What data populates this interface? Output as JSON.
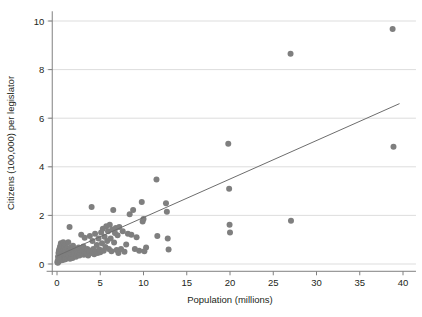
{
  "chart_data": {
    "type": "scatter",
    "title": "",
    "xlabel": "Population (millions)",
    "ylabel": "Citizens (100,000) per legislator",
    "xlim": [
      -1.2,
      41.5
    ],
    "ylim": [
      -0.45,
      10.4
    ],
    "xticks": [
      0,
      5,
      10,
      15,
      20,
      25,
      30,
      35,
      40
    ],
    "xticklabels": [
      "0",
      "5",
      "10",
      "15",
      "20",
      "25",
      "30",
      "35",
      "40"
    ],
    "yticks": [
      0,
      2,
      4,
      6,
      8,
      10
    ],
    "yticklabels": [
      "0",
      "2",
      "4",
      "6",
      "8",
      "10"
    ],
    "grid": "horizontal",
    "legend": "none",
    "marker_color": "#7f7f7f",
    "line_color": "#6d6d6d",
    "grid_color": "#d9d9d9",
    "axis_color": "#808080",
    "marker_size": 3.0,
    "series": [
      {
        "name": "countries",
        "type": "scatter",
        "points": [
          [
            0.05,
            0.07
          ],
          [
            0.08,
            0.12
          ],
          [
            0.1,
            0.05
          ],
          [
            0.12,
            0.3
          ],
          [
            0.15,
            0.18
          ],
          [
            0.17,
            0.45
          ],
          [
            0.2,
            0.1
          ],
          [
            0.22,
            0.55
          ],
          [
            0.25,
            0.25
          ],
          [
            0.28,
            0.62
          ],
          [
            0.3,
            0.38
          ],
          [
            0.32,
            0.15
          ],
          [
            0.35,
            0.72
          ],
          [
            0.38,
            0.3
          ],
          [
            0.4,
            0.5
          ],
          [
            0.42,
            0.2
          ],
          [
            0.45,
            0.85
          ],
          [
            0.48,
            0.4
          ],
          [
            0.5,
            0.28
          ],
          [
            0.52,
            0.6
          ],
          [
            0.55,
            0.15
          ],
          [
            0.58,
            0.45
          ],
          [
            0.6,
            0.75
          ],
          [
            0.62,
            0.33
          ],
          [
            0.65,
            0.22
          ],
          [
            0.68,
            0.55
          ],
          [
            0.7,
            0.4
          ],
          [
            0.72,
            0.9
          ],
          [
            0.75,
            0.18
          ],
          [
            0.78,
            0.62
          ],
          [
            0.8,
            0.35
          ],
          [
            0.82,
            0.48
          ],
          [
            0.85,
            0.25
          ],
          [
            0.88,
            0.7
          ],
          [
            0.9,
            0.42
          ],
          [
            0.92,
            0.3
          ],
          [
            0.95,
            0.58
          ],
          [
            0.98,
            0.2
          ],
          [
            1.0,
            0.45
          ],
          [
            1.02,
            0.8
          ],
          [
            1.05,
            0.33
          ],
          [
            1.1,
            0.5
          ],
          [
            1.15,
            0.65
          ],
          [
            1.2,
            0.28
          ],
          [
            1.25,
            0.42
          ],
          [
            1.3,
            0.9
          ],
          [
            1.35,
            0.36
          ],
          [
            1.4,
            0.55
          ],
          [
            1.45,
            1.52
          ],
          [
            1.5,
            0.22
          ],
          [
            1.55,
            0.48
          ],
          [
            1.6,
            0.68
          ],
          [
            1.65,
            0.3
          ],
          [
            1.7,
            0.42
          ],
          [
            1.75,
            0.58
          ],
          [
            1.8,
            0.25
          ],
          [
            1.85,
            0.75
          ],
          [
            1.9,
            0.38
          ],
          [
            1.95,
            0.5
          ],
          [
            2.0,
            0.45
          ],
          [
            2.1,
            0.62
          ],
          [
            2.2,
            0.3
          ],
          [
            2.3,
            0.52
          ],
          [
            2.4,
            0.4
          ],
          [
            2.5,
            0.68
          ],
          [
            2.6,
            0.35
          ],
          [
            2.7,
            0.48
          ],
          [
            2.8,
            1.2
          ],
          [
            2.85,
            0.42
          ],
          [
            2.9,
            0.58
          ],
          [
            3.0,
            0.45
          ],
          [
            3.05,
            0.72
          ],
          [
            3.1,
            0.38
          ],
          [
            3.2,
            1.08
          ],
          [
            3.3,
            0.5
          ],
          [
            3.4,
            0.42
          ],
          [
            3.5,
            0.62
          ],
          [
            3.6,
            0.35
          ],
          [
            3.7,
            0.48
          ],
          [
            3.8,
            1.15
          ],
          [
            3.9,
            0.55
          ],
          [
            4.0,
            2.35
          ],
          [
            4.05,
            0.45
          ],
          [
            4.1,
            0.95
          ],
          [
            4.2,
            0.62
          ],
          [
            4.3,
            0.4
          ],
          [
            4.4,
            1.25
          ],
          [
            4.5,
            0.52
          ],
          [
            4.6,
            0.78
          ],
          [
            4.7,
            0.45
          ],
          [
            4.8,
            1.05
          ],
          [
            4.9,
            0.6
          ],
          [
            5.0,
            0.48
          ],
          [
            5.1,
            1.3
          ],
          [
            5.2,
            0.85
          ],
          [
            5.3,
            1.45
          ],
          [
            5.4,
            0.55
          ],
          [
            5.5,
            1.12
          ],
          [
            5.6,
            0.7
          ],
          [
            5.7,
            1.55
          ],
          [
            5.8,
            0.95
          ],
          [
            5.9,
            1.35
          ],
          [
            6.0,
            0.62
          ],
          [
            6.1,
            1.62
          ],
          [
            6.2,
            1.05
          ],
          [
            6.3,
            0.52
          ],
          [
            6.4,
            1.42
          ],
          [
            6.5,
            2.22
          ],
          [
            6.6,
            0.88
          ],
          [
            6.7,
            1.28
          ],
          [
            6.8,
            1.48
          ],
          [
            6.9,
            0.58
          ],
          [
            7.0,
            1.18
          ],
          [
            7.1,
            0.45
          ],
          [
            7.2,
            1.52
          ],
          [
            7.4,
            0.62
          ],
          [
            7.6,
            1.35
          ],
          [
            7.8,
            0.5
          ],
          [
            8.0,
            0.8
          ],
          [
            8.2,
            1.25
          ],
          [
            8.4,
            2.05
          ],
          [
            8.6,
            1.2
          ],
          [
            8.8,
            2.22
          ],
          [
            9.0,
            0.62
          ],
          [
            9.2,
            1.1
          ],
          [
            9.5,
            0.55
          ],
          [
            9.8,
            2.55
          ],
          [
            9.9,
            1.75
          ],
          [
            10.0,
            1.85
          ],
          [
            10.1,
            0.52
          ],
          [
            10.3,
            0.68
          ],
          [
            11.5,
            3.48
          ],
          [
            11.6,
            1.15
          ],
          [
            12.6,
            2.5
          ],
          [
            12.7,
            2.15
          ],
          [
            12.8,
            1.05
          ],
          [
            12.9,
            0.6
          ],
          [
            19.8,
            4.95
          ],
          [
            19.9,
            3.1
          ],
          [
            19.95,
            1.62
          ],
          [
            20.0,
            1.3
          ],
          [
            27.0,
            8.65
          ],
          [
            27.05,
            1.78
          ],
          [
            38.8,
            9.67
          ],
          [
            38.9,
            4.82
          ]
        ]
      },
      {
        "name": "fit-line",
        "type": "line",
        "x0": 0.0,
        "y0": 0.33,
        "x1": 39.6,
        "y1": 6.6
      }
    ]
  }
}
